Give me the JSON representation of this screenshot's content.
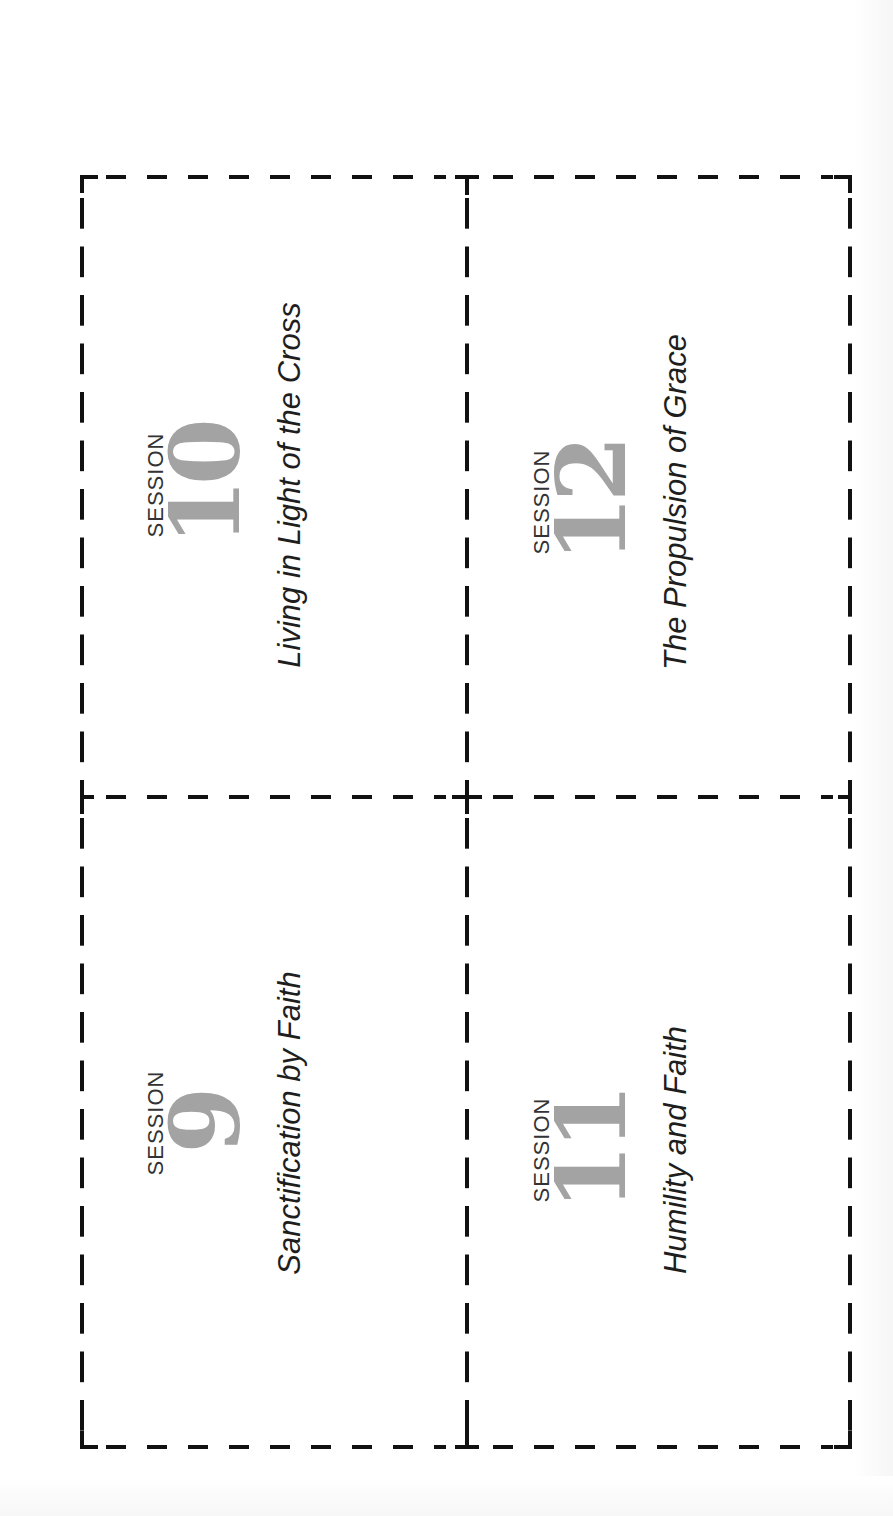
{
  "sheet": {
    "type": "printable-session-cards",
    "cut_line_color": "#111111",
    "number_color": "#a3a3a3",
    "label_color": "#333333",
    "title_color": "#1e1e1e"
  },
  "cards": [
    {
      "position": "top-left",
      "label": "SESSION",
      "number": "10",
      "title": "Living in Light of the Cross"
    },
    {
      "position": "top-right",
      "label": "SESSION",
      "number": "12",
      "title": "The Propulsion of Grace"
    },
    {
      "position": "bottom-left",
      "label": "SESSION",
      "number": "9",
      "title": "Sanctification by Faith"
    },
    {
      "position": "bottom-right",
      "label": "SESSION",
      "number": "11",
      "title": "Humility and Faith"
    }
  ]
}
